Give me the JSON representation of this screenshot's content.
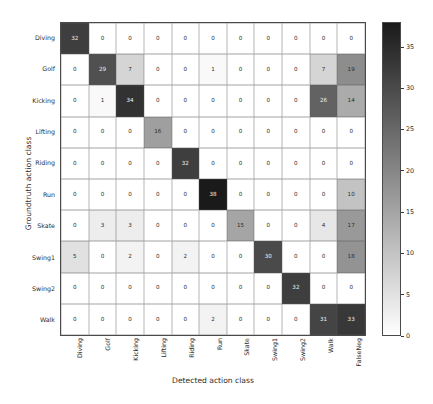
{
  "chart_data": {
    "type": "heatmap",
    "title": "",
    "xlabel": "Detected action class",
    "ylabel": "Groundtruth action class",
    "x_categories": [
      "Diving",
      "Golf",
      "Kicking",
      "Lifting",
      "Riding",
      "Run",
      "Skate",
      "Swing1",
      "Swing2",
      "Walk",
      "FalseNeg"
    ],
    "y_categories": [
      "Diving",
      "Golf",
      "Kicking",
      "Lifting",
      "Riding",
      "Run",
      "Skate",
      "Swing1",
      "Swing2",
      "Walk"
    ],
    "values": [
      [
        32,
        0,
        0,
        0,
        0,
        0,
        0,
        0,
        0,
        0,
        0
      ],
      [
        0,
        29,
        7,
        0,
        0,
        1,
        0,
        0,
        0,
        7,
        19
      ],
      [
        0,
        1,
        34,
        0,
        0,
        0,
        0,
        0,
        0,
        26,
        14
      ],
      [
        0,
        0,
        0,
        16,
        0,
        0,
        0,
        0,
        0,
        0,
        0
      ],
      [
        0,
        0,
        0,
        0,
        32,
        0,
        0,
        0,
        0,
        0,
        0
      ],
      [
        0,
        0,
        0,
        0,
        0,
        38,
        0,
        0,
        0,
        0,
        10
      ],
      [
        0,
        3,
        3,
        0,
        0,
        0,
        15,
        0,
        0,
        4,
        17
      ],
      [
        5,
        0,
        2,
        0,
        2,
        0,
        0,
        30,
        0,
        0,
        18
      ],
      [
        0,
        0,
        0,
        0,
        0,
        0,
        0,
        0,
        32,
        0,
        0
      ],
      [
        0,
        0,
        0,
        0,
        0,
        2,
        0,
        0,
        0,
        31,
        33
      ]
    ],
    "colormap": "gray_r",
    "vmin": 0,
    "vmax": 38,
    "colorbar": {
      "ticks": [
        0,
        5,
        10,
        15,
        20,
        25,
        30,
        35
      ],
      "position": "right"
    },
    "grid": true,
    "legend": "none"
  },
  "colors": {
    "low": "#ffffff",
    "high": "#1a1a1a",
    "text_dark": "#2c2c2c",
    "text_light": "#f2f2f2",
    "grid_line": "#5a5a5a",
    "axis_line": "#4a4a4a"
  }
}
